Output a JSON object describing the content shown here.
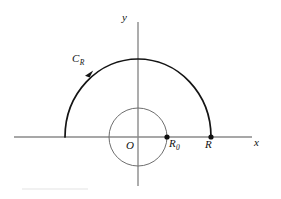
{
  "figure": {
    "background_color": "#ffffff",
    "width": 281,
    "height": 199,
    "axes": {
      "x_axis_label": "x",
      "y_axis_label": "y",
      "origin_label": "O",
      "axis_color": "#8a8a8a",
      "origin_px": {
        "x": 138,
        "y": 137
      },
      "x_axis_extent_px": {
        "x1": 14,
        "x2": 252
      },
      "y_axis_extent_px": {
        "y1": 22,
        "y2": 186
      }
    },
    "contour": {
      "label": "C",
      "label_subscript": "R",
      "color": "#141414",
      "radius_x_px": 73,
      "radius_y_px": 78,
      "arc_start_deg": 0,
      "arc_end_deg": 180,
      "direction": "counterclockwise",
      "arrow_angle_deg": 143
    },
    "inner_circle": {
      "color": "#6e6e6e",
      "radius_px": 29,
      "closed": true
    },
    "points": [
      {
        "name": "R0",
        "label": "R",
        "label_subscript": "0",
        "x_px": 167,
        "y_px": 137,
        "marker": "filled-dot",
        "radius_px": 2.6
      },
      {
        "name": "R",
        "label": "R",
        "label_subscript": "",
        "x_px": 211,
        "y_px": 137,
        "marker": "filled-dot",
        "radius_px": 2.6
      }
    ],
    "footer_rule": {
      "color": "#e3e3e3",
      "x1": 22,
      "x2": 88,
      "y": 189
    }
  }
}
